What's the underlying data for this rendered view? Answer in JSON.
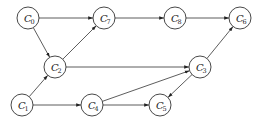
{
  "diagram": {
    "type": "directed-graph",
    "node_radius": 11,
    "nodes": [
      {
        "id": "C0",
        "letter": "C",
        "sub": "0",
        "x": 28,
        "y": 18
      },
      {
        "id": "C7",
        "letter": "C",
        "sub": "7",
        "x": 104,
        "y": 18
      },
      {
        "id": "C8",
        "letter": "C",
        "sub": "8",
        "x": 175,
        "y": 18
      },
      {
        "id": "C6",
        "letter": "C",
        "sub": "6",
        "x": 240,
        "y": 18
      },
      {
        "id": "C2",
        "letter": "C",
        "sub": "2",
        "x": 55,
        "y": 67
      },
      {
        "id": "C3",
        "letter": "C",
        "sub": "3",
        "x": 200,
        "y": 67
      },
      {
        "id": "C1",
        "letter": "C",
        "sub": "1",
        "x": 22,
        "y": 105
      },
      {
        "id": "C4",
        "letter": "C",
        "sub": "4",
        "x": 92,
        "y": 105
      },
      {
        "id": "C5",
        "letter": "C",
        "sub": "5",
        "x": 160,
        "y": 105
      }
    ],
    "edges": [
      {
        "from": "C0",
        "to": "C7"
      },
      {
        "from": "C0",
        "to": "C2"
      },
      {
        "from": "C2",
        "to": "C7"
      },
      {
        "from": "C7",
        "to": "C8"
      },
      {
        "from": "C8",
        "to": "C6"
      },
      {
        "from": "C3",
        "to": "C6"
      },
      {
        "from": "C2",
        "to": "C3"
      },
      {
        "from": "C1",
        "to": "C2"
      },
      {
        "from": "C1",
        "to": "C4"
      },
      {
        "from": "C4",
        "to": "C3"
      },
      {
        "from": "C4",
        "to": "C5"
      },
      {
        "from": "C3",
        "to": "C5"
      }
    ]
  }
}
